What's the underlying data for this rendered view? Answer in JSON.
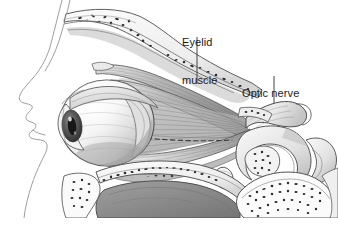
{
  "figure": {
    "medium": "graphite pencil medical illustration",
    "background_color": "#ffffff",
    "ink_color": "#3a3a3a",
    "width": 338,
    "height": 237
  },
  "labels": [
    {
      "id": "eyelid-muscle",
      "line1": "Eyelid",
      "line2": "muscle",
      "text": "Eyelid muscle",
      "x": 182,
      "y": 11,
      "leader": {
        "x1": 197,
        "y1": 37,
        "x2": 197,
        "y2": 84
      }
    },
    {
      "id": "optic-nerve",
      "line1": "Optic nerve",
      "line2": "",
      "text": "Optic nerve",
      "x": 242,
      "y": 62,
      "leader": {
        "x1": 274,
        "y1": 76,
        "x2": 274,
        "y2": 103
      }
    }
  ],
  "structures": [
    "facial profile outline",
    "frontal bone with cancellous stippling",
    "orbital roof",
    "eyeball (globe)",
    "cornea and iris with pupil",
    "levator palpebrae superioris",
    "superior rectus muscle",
    "inferior rectus muscle",
    "orbital fat",
    "optic nerve",
    "sphenoid bone",
    "orbital floor",
    "maxillary sinus",
    "pterygoid region bone with stippling"
  ]
}
